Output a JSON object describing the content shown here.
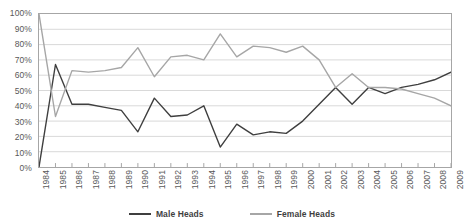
{
  "chart_data": {
    "type": "line",
    "title": "",
    "subtitle": "",
    "xlabel": "",
    "ylabel": "",
    "x": [
      1984,
      1985,
      1986,
      1987,
      1988,
      1989,
      1990,
      1991,
      1992,
      1993,
      1994,
      1995,
      1996,
      1997,
      1998,
      1999,
      2000,
      2001,
      2002,
      2003,
      2004,
      2005,
      2006,
      2007,
      2008,
      2009
    ],
    "xtick_labels": [
      "1984",
      "1985",
      "1986",
      "1987",
      "1988",
      "1989",
      "1990",
      "1991",
      "1992",
      "1993",
      "1994",
      "1995",
      "1996",
      "1997",
      "1998",
      "1999",
      "2000",
      "2001",
      "2002",
      "2003",
      "2004",
      "2005",
      "2006",
      "2007",
      "2008",
      "2009"
    ],
    "ytick_labels": [
      "0%",
      "10%",
      "20%",
      "30%",
      "40%",
      "50%",
      "60%",
      "70%",
      "80%",
      "90%",
      "100%"
    ],
    "ytick_values": [
      0,
      10,
      20,
      30,
      40,
      50,
      60,
      70,
      80,
      90,
      100
    ],
    "ylim": [
      0,
      100
    ],
    "grid": "horizontal",
    "legend_position": "bottom",
    "series": [
      {
        "name": "Male Heads",
        "color": "#3f3f3f",
        "values": [
          0,
          67,
          41,
          41,
          39,
          37,
          23,
          45,
          33,
          34,
          40,
          13,
          28,
          21,
          23,
          22,
          30,
          41,
          52,
          41,
          52,
          48,
          52,
          54,
          57,
          62
        ]
      },
      {
        "name": "Female Heads",
        "color": "#a6a6a6",
        "values": [
          100,
          33,
          63,
          62,
          63,
          65,
          78,
          59,
          72,
          73,
          70,
          87,
          72,
          79,
          78,
          75,
          79,
          70,
          52,
          61,
          52,
          52,
          51,
          48,
          45,
          40
        ]
      }
    ]
  },
  "legend": {
    "items": [
      {
        "label": "Male Heads",
        "color": "#3f3f3f"
      },
      {
        "label": "Female Heads",
        "color": "#a6a6a6"
      }
    ]
  },
  "colors": {
    "male": "#3f3f3f",
    "female": "#a6a6a6",
    "grid": "#d9d9d9",
    "frame": "#a6a6a6",
    "axis_text": "#595959"
  }
}
